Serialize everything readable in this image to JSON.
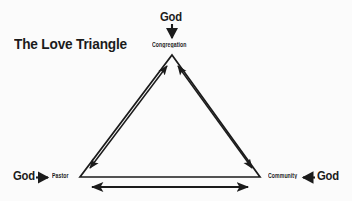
{
  "canvas": {
    "width": 352,
    "height": 201,
    "background_color": "#fbfbfb",
    "ink_color": "#1b1b1b"
  },
  "title": {
    "text": "The Love Triangle"
  },
  "nodes": {
    "congregation": {
      "label": "Congregation"
    },
    "pastor": {
      "label": "Pastor"
    },
    "community": {
      "label": "Community"
    }
  },
  "god_labels": {
    "top": {
      "text": "God"
    },
    "left": {
      "text": "God"
    },
    "right": {
      "text": "God"
    }
  },
  "shapes": {
    "triangle": {
      "apex": {
        "x": 172,
        "y": 55
      },
      "bottom_left": {
        "x": 80,
        "y": 177
      },
      "bottom_right": {
        "x": 260,
        "y": 177
      },
      "stroke_width": 1.6
    },
    "god_arrows": [
      {
        "name": "god-to-congregation",
        "direction": "down",
        "from": {
          "x": 172,
          "y": 24
        },
        "to": {
          "x": 172,
          "y": 38
        }
      },
      {
        "name": "god-to-pastor",
        "direction": "right",
        "from": {
          "x": 36,
          "y": 177
        },
        "to": {
          "x": 49,
          "y": 177
        }
      },
      {
        "name": "god-to-community",
        "direction": "left",
        "from": {
          "x": 314,
          "y": 177
        },
        "to": {
          "x": 301,
          "y": 177
        }
      }
    ],
    "relationship_arrows": [
      {
        "name": "pastor-congregation-arrow",
        "type": "double-headed",
        "from": {
          "x": 91,
          "y": 170
        },
        "to": {
          "x": 167,
          "y": 66
        }
      },
      {
        "name": "congregation-community-arrow",
        "type": "double-headed",
        "from": {
          "x": 178,
          "y": 66
        },
        "to": {
          "x": 251,
          "y": 170
        }
      },
      {
        "name": "pastor-community-arrow",
        "type": "double-headed",
        "from": {
          "x": 91,
          "y": 187
        },
        "to": {
          "x": 249,
          "y": 187
        }
      }
    ]
  }
}
